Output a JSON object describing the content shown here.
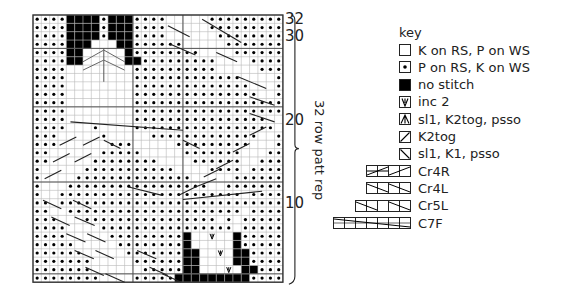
{
  "chart": {
    "cols": 30,
    "rows_count": 32,
    "origin_x": 33,
    "origin_y": 15,
    "cell_w": 8.33,
    "cell_h": 8.35,
    "grid_line_color": "#b9b9b9",
    "major_line_color": "#555555",
    "purl_dot_color": "#000000",
    "no_stitch_color": "#000000",
    "row_labels": [
      {
        "row": 32,
        "text": "32"
      },
      {
        "row": 30,
        "text": "30"
      },
      {
        "row": 20,
        "text": "20"
      },
      {
        "row": 10,
        "text": "10"
      }
    ],
    "rows": [
      "oooo####o###oooo.....ooooooooo",
      "oooo####o###oooo.....ooooooooo",
      "oooo####o###oooo......oooooooo",
      "oooo###...##oooooo.....ooooooo",
      "oooo##.....#oooooooo....oooooo",
      "oooo##.....##ooooooooo....oooo",
      "oooo........oooooooooo.....ooo",
      "oooo........ooooooooooooo....o",
      "oooo........oooooooooooooo...o",
      "oooo........ooooooooooooooo..o",
      "oooo........oooooooooooooooooo",
      "oooo........oooooooooooooooooo",
      "oooo........oooooooooooooooo..",
      "oooo...o....ooooooooooooooooo.",
      "ooo.....o.....ooooooooooooo..o",
      "ooo......ooo.....ooooooooo...o",
      "oo......ooooo.....ooooooo...oo",
      "oo.....oooooooo....oooooo..ooo",
      "o.....ooooooooooo....oooo.oooo",
      "o....oooooooooooooo.....oooooo",
      "o...ooooooooooooooooo..ooooooo",
      "o..oooooooooooooooooooooo.oooo",
      "oo.ooooooooooooooooooooooooooo",
      "oo..ooooooooooooooooooooo.oooo",
      "ooo...oooooooooooooooo.o.ooooo",
      "oooo....oooooooooooooooo.ooooo",
      "oooo.....ooooooooo#..v..#ooooo",
      "ooooo.....oooooooo#.....#ooooo",
      "oooooo.....ooooooo##..v.##oooo",
      "ooooooo.....oooooo##....##oooo",
      "ooooooo......ooooo##...v.##ooo",
      "oooooooo....ooooo#########oooo"
    ],
    "v_dividers_col": [
      12,
      18
    ],
    "h_dividers_row": [
      4,
      11,
      20,
      31
    ],
    "cable_lines": [
      {
        "x1": 16.5,
        "y1": 3.5,
        "x2": 19.5,
        "y2": 4.8
      },
      {
        "x1": 16.2,
        "y1": 1.3,
        "x2": 18.8,
        "y2": 2.6
      },
      {
        "x1": 20.3,
        "y1": 0.5,
        "x2": 25.0,
        "y2": 3.3
      },
      {
        "x1": 22.0,
        "y1": 4.5,
        "x2": 24.5,
        "y2": 5.6
      },
      {
        "x1": 24.6,
        "y1": 7.4,
        "x2": 28.0,
        "y2": 8.8
      },
      {
        "x1": 26.0,
        "y1": 9.8,
        "x2": 29.0,
        "y2": 10.8
      },
      {
        "x1": 26.0,
        "y1": 11.8,
        "x2": 29.0,
        "y2": 12.8
      },
      {
        "x1": 4.5,
        "y1": 12.8,
        "x2": 18.0,
        "y2": 13.8
      },
      {
        "x1": 3.2,
        "y1": 15.6,
        "x2": 5.2,
        "y2": 14.6
      },
      {
        "x1": 6.0,
        "y1": 15.6,
        "x2": 8.0,
        "y2": 14.6
      },
      {
        "x1": 2.4,
        "y1": 17.6,
        "x2": 4.4,
        "y2": 16.6
      },
      {
        "x1": 5.0,
        "y1": 17.6,
        "x2": 7.0,
        "y2": 16.6
      },
      {
        "x1": 1.4,
        "y1": 19.6,
        "x2": 3.4,
        "y2": 18.6
      },
      {
        "x1": 8.5,
        "y1": 15.0,
        "x2": 10.5,
        "y2": 16.0
      },
      {
        "x1": 18.0,
        "y1": 15.0,
        "x2": 20.0,
        "y2": 16.0
      },
      {
        "x1": 26.0,
        "y1": 14.4,
        "x2": 28.0,
        "y2": 13.4
      },
      {
        "x1": 24.0,
        "y1": 16.4,
        "x2": 26.0,
        "y2": 15.4
      },
      {
        "x1": 22.0,
        "y1": 18.4,
        "x2": 24.0,
        "y2": 17.4
      },
      {
        "x1": 20.5,
        "y1": 19.4,
        "x2": 22.5,
        "y2": 18.4
      },
      {
        "x1": 17.5,
        "y1": 21.6,
        "x2": 19.5,
        "y2": 20.6
      },
      {
        "x1": 19.5,
        "y1": 20.6,
        "x2": 22.0,
        "y2": 19.6
      },
      {
        "x1": 11.5,
        "y1": 20.6,
        "x2": 15.5,
        "y2": 21.6
      },
      {
        "x1": 18.0,
        "y1": 22.1,
        "x2": 27.5,
        "y2": 21.1
      },
      {
        "x1": 1.2,
        "y1": 22.2,
        "x2": 3.4,
        "y2": 23.2
      },
      {
        "x1": 4.8,
        "y1": 22.2,
        "x2": 7.0,
        "y2": 23.2
      },
      {
        "x1": 2.2,
        "y1": 24.2,
        "x2": 4.4,
        "y2": 25.2
      },
      {
        "x1": 5.0,
        "y1": 24.2,
        "x2": 7.4,
        "y2": 25.2
      },
      {
        "x1": 4.0,
        "y1": 26.2,
        "x2": 6.3,
        "y2": 27.2
      },
      {
        "x1": 6.5,
        "y1": 26.2,
        "x2": 8.7,
        "y2": 27.2
      },
      {
        "x1": 5.0,
        "y1": 28.2,
        "x2": 7.3,
        "y2": 29.2
      },
      {
        "x1": 7.5,
        "y1": 28.2,
        "x2": 9.7,
        "y2": 29.2
      },
      {
        "x1": 12.5,
        "y1": 28.2,
        "x2": 14.8,
        "y2": 29.2
      },
      {
        "x1": 14.0,
        "y1": 30.2,
        "x2": 16.2,
        "y2": 31.2
      },
      {
        "x1": 6.3,
        "y1": 30.2,
        "x2": 8.5,
        "y2": 31.2
      },
      {
        "x1": 8.7,
        "y1": 31.0,
        "x2": 11.0,
        "y2": 32.0
      },
      {
        "x1": 15.5,
        "y1": 31.0,
        "x2": 17.8,
        "y2": 32.0
      }
    ],
    "arrow_marks": [
      {
        "type": "decrease-peak",
        "col": 8.5,
        "row_top": 4.2,
        "row_bottom": 5.6
      },
      {
        "type": "decrease-peak",
        "col": 8.5,
        "row_top": 5.4,
        "row_bottom": 6.6
      }
    ],
    "center_line_col": 8.5
  },
  "brace": {
    "label": "32 row patt rep"
  },
  "key": {
    "title": "key",
    "items": [
      {
        "symbol": "knit",
        "label": "K on RS, P on WS"
      },
      {
        "symbol": "purl",
        "label": "P on RS, K on WS"
      },
      {
        "symbol": "no-stitch",
        "label": "no stitch"
      },
      {
        "symbol": "inc2",
        "label": "inc 2"
      },
      {
        "symbol": "sl1-k2tog-psso",
        "label": "sl1, K2tog, psso"
      },
      {
        "symbol": "k2tog",
        "label": "K2tog"
      },
      {
        "symbol": "sl1-k1-psso",
        "label": "sl1, K1, psso"
      },
      {
        "symbol": "cr4r",
        "cells": 4,
        "label": "Cr4R"
      },
      {
        "symbol": "cr4l",
        "cells": 4,
        "label": "Cr4L"
      },
      {
        "symbol": "cr5l",
        "cells": 5,
        "label": "Cr5L"
      },
      {
        "symbol": "c7f",
        "cells": 7,
        "label": "C7F"
      }
    ]
  }
}
